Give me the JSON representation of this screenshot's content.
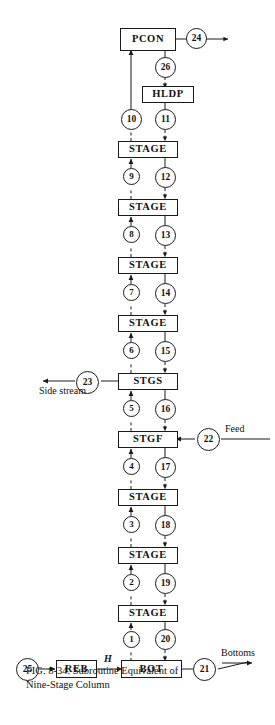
{
  "figure": {
    "caption_line1": "FIG.    8-34.    Subroutine    Equivalent    of",
    "caption_line2": "Nine-Stage  Column",
    "background": "#ffffff",
    "ink": "#1a1a1a"
  },
  "boxes": {
    "pcon": "PCON",
    "hldp": "HLDP",
    "stage_a": "STAGE",
    "stage_b": "STAGE",
    "stage_c": "STAGE",
    "stage_d": "STAGE",
    "stgs": "STGS",
    "stgf": "STGF",
    "stage_e": "STAGE",
    "stage_f": "STAGE",
    "stage_g": "STAGE",
    "reb": "REB",
    "bot": "BOT"
  },
  "streams": {
    "s1": "1",
    "s2": "2",
    "s3": "3",
    "s4": "4",
    "s5": "5",
    "s6": "6",
    "s7": "7",
    "s8": "8",
    "s9": "9",
    "s10": "10",
    "s11": "11",
    "s12": "12",
    "s13": "13",
    "s14": "14",
    "s15": "15",
    "s16": "16",
    "s17": "17",
    "s18": "18",
    "s19": "19",
    "s20": "20",
    "s21": "21",
    "s22": "22",
    "s23": "23",
    "s24": "24",
    "s25": "25",
    "s26": "26"
  },
  "labels": {
    "side_stream": "Side stream",
    "feed": "Feed",
    "bottoms": "Bottoms",
    "enthalpy": "H"
  }
}
